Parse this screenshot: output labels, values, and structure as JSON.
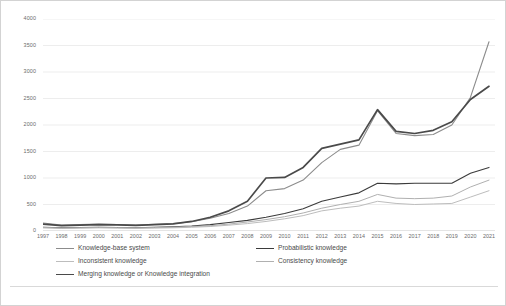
{
  "chart_data": {
    "type": "line",
    "title": "",
    "xlabel": "",
    "ylabel": "",
    "ylim": [
      0,
      4000
    ],
    "ytick_values": [
      0,
      500,
      1000,
      1500,
      2000,
      2500,
      3000,
      3500,
      4000
    ],
    "ytick_labels": [
      "0",
      "500",
      "1000",
      "1500",
      "2000",
      "2500",
      "3000",
      "3500",
      "4000"
    ],
    "grid": true,
    "grid_axis": "y",
    "legend_position": "bottom",
    "categories": [
      "1997",
      "1998",
      "1999",
      "2000",
      "2001",
      "2002",
      "2003",
      "2004",
      "2005",
      "2006",
      "2007",
      "2008",
      "2009",
      "2010",
      "2011",
      "2012",
      "2013",
      "2014",
      "2015",
      "2016",
      "2017",
      "2018",
      "2019",
      "2020",
      "2021"
    ],
    "series": [
      {
        "name": "Knowledge-base system",
        "color": "#8c8c8c",
        "width": 1.1,
        "values": [
          150,
          110,
          120,
          130,
          120,
          110,
          125,
          140,
          175,
          240,
          330,
          470,
          760,
          800,
          960,
          1290,
          1540,
          1620,
          2270,
          1840,
          1800,
          1820,
          2000,
          2520,
          3570
        ]
      },
      {
        "name": "Probabilistic knowledge",
        "color": "#3b3b3b",
        "width": 1.1,
        "values": [
          70,
          60,
          65,
          70,
          65,
          60,
          70,
          80,
          95,
          120,
          160,
          200,
          260,
          330,
          420,
          560,
          640,
          720,
          900,
          890,
          900,
          900,
          900,
          1090,
          1200
        ]
      },
      {
        "name": "Inconsistent knowledge",
        "color": "#bdbdbd",
        "width": 1.0,
        "values": [
          60,
          50,
          55,
          60,
          55,
          50,
          55,
          60,
          70,
          85,
          110,
          140,
          180,
          230,
          290,
          380,
          430,
          470,
          560,
          520,
          500,
          510,
          520,
          640,
          760
        ]
      },
      {
        "name": "Consistency knowledge",
        "color": "#b0b0b0",
        "width": 1.0,
        "values": [
          65,
          55,
          60,
          65,
          62,
          58,
          64,
          72,
          85,
          100,
          130,
          170,
          215,
          270,
          340,
          430,
          500,
          560,
          690,
          620,
          610,
          620,
          660,
          830,
          960
        ]
      },
      {
        "name": "Merging knowledge or Knowledge integration",
        "color": "#4a4a4a",
        "width": 1.7,
        "values": [
          130,
          100,
          110,
          120,
          115,
          105,
          120,
          135,
          180,
          260,
          380,
          560,
          1000,
          1010,
          1200,
          1560,
          1640,
          1720,
          2290,
          1880,
          1840,
          1900,
          2060,
          2480,
          2730
        ]
      }
    ]
  },
  "legend": {
    "entries": [
      {
        "label": "Knowledge-base system"
      },
      {
        "label": "Probabilistic knowledge"
      },
      {
        "label": "Inconsistent knowledge"
      },
      {
        "label": "Consistency knowledge"
      },
      {
        "label": "Merging knowledge or Knowledge integration"
      }
    ]
  }
}
